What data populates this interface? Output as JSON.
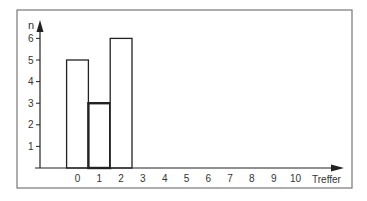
{
  "chart_data": {
    "type": "bar",
    "title": "",
    "xlabel": "Treffer",
    "ylabel": "n",
    "categories": [
      "0",
      "1",
      "2",
      "3",
      "4",
      "5",
      "6",
      "7",
      "8",
      "9",
      "10"
    ],
    "values": [
      5,
      3,
      6,
      0,
      0,
      0,
      0,
      0,
      0,
      0,
      0
    ],
    "highlighted_bar": "1",
    "yticks": [
      1,
      2,
      3,
      4,
      5,
      6
    ],
    "xticks": [
      0,
      1,
      2,
      3,
      4,
      5,
      6,
      7,
      8,
      9,
      10
    ],
    "ylim": [
      0,
      6.8
    ],
    "grid": false,
    "legend": null
  },
  "colors": {
    "frame": "#777777",
    "axis": "#222222",
    "bar_fill": "#ffffff",
    "bar_stroke": "#222222",
    "text": "#333333"
  }
}
